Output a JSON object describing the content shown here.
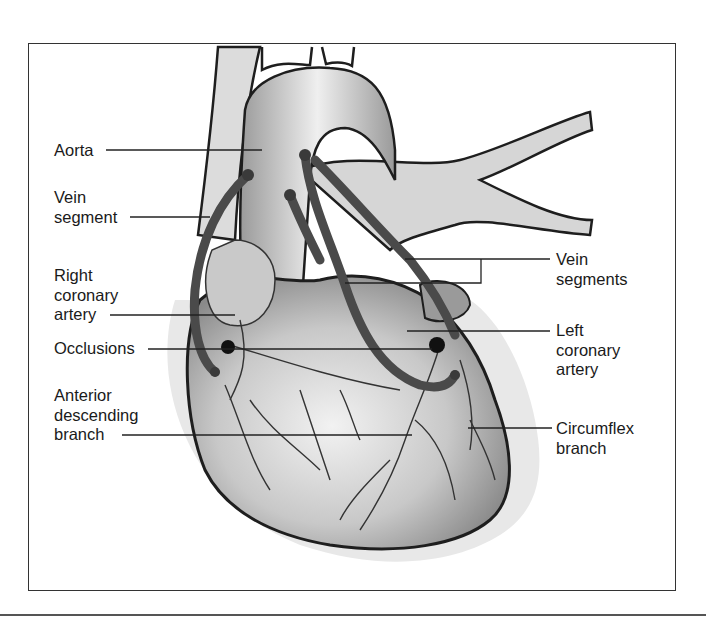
{
  "figure": {
    "labels_left": [
      {
        "id": "aorta",
        "lines": [
          "Aorta"
        ]
      },
      {
        "id": "vein-segment",
        "lines": [
          "Vein",
          "segment"
        ]
      },
      {
        "id": "right-coronary-artery",
        "lines": [
          "Right",
          "coronary",
          "artery"
        ]
      },
      {
        "id": "occlusions",
        "lines": [
          "Occlusions"
        ]
      },
      {
        "id": "anterior-descending-branch",
        "lines": [
          "Anterior",
          "descending",
          "branch"
        ]
      }
    ],
    "labels_right": [
      {
        "id": "vein-segments",
        "lines": [
          "Vein",
          "segments"
        ]
      },
      {
        "id": "left-coronary-artery",
        "lines": [
          "Left",
          "coronary",
          "artery"
        ]
      },
      {
        "id": "circumflex-branch",
        "lines": [
          "Circumflex",
          "branch"
        ]
      }
    ]
  },
  "colors": {
    "frame": "#333333",
    "text": "#1a1a1a",
    "vein_graft": "#4a4a4a",
    "heart_fill": "#d9d9d9",
    "outline": "#1e1e1e"
  }
}
